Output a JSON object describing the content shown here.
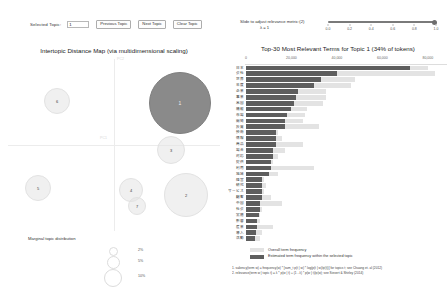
{
  "controls": {
    "selected_topic_label": "Selected Topic:",
    "selected_topic_value": "1",
    "previous_button": "Previous Topic",
    "next_button": "Next Topic",
    "clear_button": "Clear Topic"
  },
  "slider": {
    "label": "Slide to adjust relevance metric:(2)",
    "lambda_label": "λ = 1",
    "value": 1.0,
    "ticks": [
      "0.0",
      "0.2",
      "0.4",
      "0.6",
      "0.8",
      "1.0"
    ],
    "track_color": "#7a7a7a"
  },
  "left_panel": {
    "title": "Intertopic Distance Map (via multidimensional scaling)",
    "axis_x_label": "PC1",
    "axis_y_label": "PC2",
    "marginal_title": "Marginal topic distribution",
    "marginal_legend": [
      "2%",
      "5%",
      "10%"
    ],
    "selected_color": "#8a8a8a",
    "bubble_color": "#e4e4e4",
    "topics": [
      {
        "id": "1",
        "x": 180,
        "y": 48,
        "r": 31,
        "selected": true
      },
      {
        "id": "2",
        "x": 186,
        "y": 140,
        "r": 22,
        "selected": false
      },
      {
        "id": "3",
        "x": 171,
        "y": 95,
        "r": 14,
        "selected": false
      },
      {
        "id": "4",
        "x": 131,
        "y": 135,
        "r": 12,
        "selected": false
      },
      {
        "id": "5",
        "x": 38,
        "y": 133,
        "r": 13,
        "selected": false
      },
      {
        "id": "6",
        "x": 57,
        "y": 46,
        "r": 13,
        "selected": false
      },
      {
        "id": "7",
        "x": 137,
        "y": 151,
        "r": 9,
        "selected": false
      }
    ]
  },
  "chart_data": {
    "type": "bar",
    "title": "Top-30 Most Relevant Terms for Topic 1 (34% of tokens)",
    "xlabel": "",
    "ylabel": "",
    "xlim": [
      0,
      88000
    ],
    "xticks": [
      0,
      20000,
      40000,
      60000,
      80000
    ],
    "xtick_labels": [
      "0",
      "20,000",
      "40,000",
      "60,000",
      "80,000"
    ],
    "grid": false,
    "legend_position": "bottom",
    "series": [
      {
        "name": "Overall term frequency",
        "color": "#e3e3e3"
      },
      {
        "name": "Estimated term frequency within the selected topic",
        "color": "#5e5e5e"
      }
    ],
    "categories": [
      "日本",
      "会社",
      "世界",
      "年度",
      "企業",
      "事業",
      "米国",
      "機能",
      "市場",
      "開発",
      "投資",
      "技術",
      "情報",
      "商品",
      "場合",
      "対応",
      "提供",
      "利用",
      "地域",
      "経営",
      "研究",
      "サービス",
      "顧客",
      "中国",
      "社会",
      "実施",
      "影響",
      "産業",
      "導入",
      "活動"
    ],
    "overall_values": [
      80000,
      83000,
      48000,
      46000,
      35000,
      35000,
      34000,
      27000,
      26000,
      25000,
      32000,
      14000,
      16000,
      25000,
      17000,
      14000,
      12000,
      30000,
      14000,
      8000,
      9000,
      8000,
      11000,
      16000,
      7000,
      6000,
      6000,
      12000,
      7000,
      6000
    ],
    "topic_values": [
      72000,
      40000,
      33000,
      30000,
      23000,
      22000,
      21000,
      20000,
      18000,
      17000,
      17000,
      13000,
      13000,
      13000,
      12000,
      12000,
      11000,
      11000,
      10000,
      7000,
      7000,
      7000,
      7000,
      6000,
      6000,
      5500,
      5000,
      5000,
      4500,
      4000
    ]
  },
  "footnotes": [
    "1. saliency(term w) = frequency(w) * [sum_t p(t | w) * log(p(t | w)/p(t))] for topics t; see Chuang et. al (2012)",
    "2. relevance(term w | topic t) = λ * p(w | t) + (1 - λ) * p(w | t)/p(w); see Sievert & Shirley (2014)"
  ]
}
